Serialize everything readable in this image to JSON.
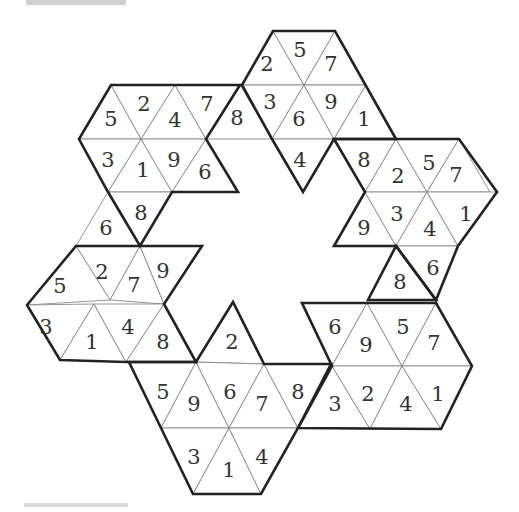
{
  "page": {
    "top_bar_color": "#cfcfcf",
    "bottom_bar_color": "#d9d9d9",
    "line_color": "#222222",
    "inner_line_color": "#888888",
    "text_color": "#333333"
  },
  "puzzle": {
    "type": "hexagonal star triangle number grid",
    "triangles": [
      {
        "id": "t1",
        "pts": "273,31 304,85 242,85",
        "label": "2",
        "lx": 267,
        "ly": 64
      },
      {
        "id": "t2",
        "pts": "273,31 335,31 304,85",
        "label": "5",
        "lx": 300,
        "ly": 50
      },
      {
        "id": "t3",
        "pts": "335,31 366,85 304,85",
        "label": "7",
        "lx": 331,
        "ly": 64
      },
      {
        "id": "t4",
        "pts": "242,85 304,85 272,139",
        "label": "3",
        "lx": 270,
        "ly": 102
      },
      {
        "id": "t5",
        "pts": "304,85 334,139 272,139",
        "label": "6",
        "lx": 299,
        "ly": 119
      },
      {
        "id": "t6",
        "pts": "304,85 366,85 334,139",
        "label": "9",
        "lx": 331,
        "ly": 102
      },
      {
        "id": "t7",
        "pts": "366,85 396,139 334,139",
        "label": "1",
        "lx": 364,
        "ly": 119
      },
      {
        "id": "t8",
        "pts": "272,139 334,139 303,192",
        "label": "4",
        "lx": 300,
        "ly": 160
      },
      {
        "id": "t9",
        "pts": "111,85 141,139 79,139",
        "label": "5",
        "lx": 111,
        "ly": 119
      },
      {
        "id": "t10",
        "pts": "111,85 175,85 141,139",
        "label": "2",
        "lx": 144,
        "ly": 104
      },
      {
        "id": "t11",
        "pts": "175,85 206,139 141,139",
        "label": "4",
        "lx": 175,
        "ly": 120
      },
      {
        "id": "t12",
        "pts": "175,85 240,85 206,139",
        "label": "7",
        "lx": 207,
        "ly": 104
      },
      {
        "id": "t13",
        "pts": "240,85 272,139 206,139",
        "label": "8",
        "lx": 237,
        "ly": 118
      },
      {
        "id": "t14",
        "pts": "79,139 141,139 108,192",
        "label": "3",
        "lx": 108,
        "ly": 160
      },
      {
        "id": "t15",
        "pts": "141,139 172,192 108,192",
        "label": "1",
        "lx": 143,
        "ly": 170
      },
      {
        "id": "t16",
        "pts": "141,139 206,139 172,192",
        "label": "9",
        "lx": 174,
        "ly": 160
      },
      {
        "id": "t17",
        "pts": "206,139 238,192 172,192",
        "label": "6",
        "lx": 205,
        "ly": 172
      },
      {
        "id": "t18",
        "pts": "108,192 172,192 140,246",
        "label": "8",
        "lx": 141,
        "ly": 213
      },
      {
        "id": "t19",
        "pts": "108,192 140,246 76,246",
        "label": "6",
        "lx": 106,
        "ly": 228
      },
      {
        "id": "t20",
        "pts": "334,139 396,139 365,192",
        "label": "8",
        "lx": 364,
        "ly": 160
      },
      {
        "id": "t21",
        "pts": "396,139 427,192 365,192",
        "label": "2",
        "lx": 398,
        "ly": 176
      },
      {
        "id": "t22",
        "pts": "396,139 459,139 427,192",
        "label": "5",
        "lx": 429,
        "ly": 163
      },
      {
        "id": "t23",
        "pts": "459,139 490,192 427,192",
        "label": "7",
        "lx": 456,
        "ly": 175
      },
      {
        "id": "t24",
        "pts": "365,192 396,246 334,246",
        "label": "9",
        "lx": 364,
        "ly": 228
      },
      {
        "id": "t25",
        "pts": "365,192 427,192 396,246",
        "label": "3",
        "lx": 397,
        "ly": 214
      },
      {
        "id": "t26",
        "pts": "427,192 458,246 396,246",
        "label": "4",
        "lx": 430,
        "ly": 229
      },
      {
        "id": "t27",
        "pts": "427,192 497,192 458,246",
        "label": "1",
        "lx": 466,
        "ly": 214
      },
      {
        "id": "t28",
        "pts": "396,246 458,246 436,300",
        "label": "6",
        "lx": 433,
        "ly": 268
      },
      {
        "id": "t29",
        "pts": "396,246 436,300 368,300",
        "label": "8",
        "lx": 400,
        "ly": 282
      },
      {
        "id": "t30",
        "pts": "76,246 140,246 110,300",
        "label": "2",
        "lx": 102,
        "ly": 272
      },
      {
        "id": "t31",
        "pts": "76,246 110,300 27,305",
        "label": "5",
        "lx": 60,
        "ly": 286
      },
      {
        "id": "t32",
        "pts": "140,246 164,304 110,300",
        "label": "7",
        "lx": 134,
        "ly": 285
      },
      {
        "id": "t33",
        "pts": "140,246 202,246 164,304",
        "label": "9",
        "lx": 163,
        "ly": 271
      },
      {
        "id": "t34",
        "pts": "27,305 94,304 60,360",
        "label": "3",
        "lx": 46,
        "ly": 327
      },
      {
        "id": "t35",
        "pts": "94,304 126,362 60,360",
        "label": "1",
        "lx": 92,
        "ly": 342
      },
      {
        "id": "t36",
        "pts": "94,304 164,304 126,362",
        "label": "4",
        "lx": 128,
        "ly": 327
      },
      {
        "id": "t37",
        "pts": "164,304 196,362 126,362",
        "label": "8",
        "lx": 163,
        "ly": 342
      },
      {
        "id": "t38",
        "pts": "233,302 264,364 196,362",
        "label": "2",
        "lx": 232,
        "ly": 342
      },
      {
        "id": "t39",
        "pts": "129,362 196,362 161,428",
        "label": "5",
        "lx": 163,
        "ly": 392
      },
      {
        "id": "t40",
        "pts": "196,362 229,428 161,428",
        "label": "9",
        "lx": 194,
        "ly": 404
      },
      {
        "id": "t41",
        "pts": "196,362 264,364 229,428",
        "label": "6",
        "lx": 230,
        "ly": 392
      },
      {
        "id": "t42",
        "pts": "264,364 298,428 229,428",
        "label": "7",
        "lx": 262,
        "ly": 404
      },
      {
        "id": "t43",
        "pts": "264,364 331,364 298,428",
        "label": "8",
        "lx": 298,
        "ly": 392
      },
      {
        "id": "t44",
        "pts": "161,428 229,428 193,494",
        "label": "3",
        "lx": 194,
        "ly": 457
      },
      {
        "id": "t45",
        "pts": "229,428 261,494 193,494",
        "label": "1",
        "lx": 229,
        "ly": 470
      },
      {
        "id": "t46",
        "pts": "229,428 298,428 261,494",
        "label": "4",
        "lx": 262,
        "ly": 457
      },
      {
        "id": "t47",
        "pts": "302,303 367,303 332,366",
        "label": "6",
        "lx": 335,
        "ly": 327
      },
      {
        "id": "t48",
        "pts": "367,303 402,366 332,366",
        "label": "9",
        "lx": 366,
        "ly": 345
      },
      {
        "id": "t49",
        "pts": "367,303 436,303 402,366",
        "label": "5",
        "lx": 403,
        "ly": 327
      },
      {
        "id": "t50",
        "pts": "436,303 472,366 402,366",
        "label": "7",
        "lx": 434,
        "ly": 343
      },
      {
        "id": "t51",
        "pts": "332,366 370,429 298,428",
        "label": "3",
        "lx": 335,
        "ly": 404
      },
      {
        "id": "t52",
        "pts": "332,366 402,366 370,429",
        "label": "2",
        "lx": 368,
        "ly": 394
      },
      {
        "id": "t53",
        "pts": "402,366 441,429 370,429",
        "label": "4",
        "lx": 406,
        "ly": 404
      },
      {
        "id": "t54",
        "pts": "402,366 472,366 441,429",
        "label": "1",
        "lx": 438,
        "ly": 394
      }
    ],
    "outlines": [
      {
        "id": "top-hex",
        "pts": "273,31 335,31 396,139 334,139 303,192 272,139 242,85"
      },
      {
        "id": "top-left-hex",
        "pts": "111,85 240,85 206,139 238,192 172,192 140,246 108,192 79,139"
      },
      {
        "id": "right-hex",
        "pts": "334,139 459,139 497,192 458,246 436,300 396,246 334,246 365,192"
      },
      {
        "id": "right-connector",
        "pts": "396,246 436,300 368,300"
      },
      {
        "id": "left-hex",
        "pts": "76,246 202,246 164,304 196,362 129,362 126,362 60,360 27,305"
      },
      {
        "id": "bottom-hex",
        "pts": "129,362 196,362 233,302 264,364 331,364 298,428 261,494 193,494 161,428"
      },
      {
        "id": "bottom-right-hex",
        "pts": "302,303 436,303 472,366 441,429 298,428 332,366"
      }
    ]
  }
}
